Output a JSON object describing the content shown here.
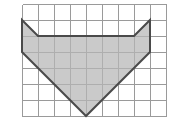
{
  "figure": {
    "background_color": "#ffffff",
    "grid": {
      "columns": 9,
      "rows": 7,
      "cell_size_px": 16,
      "origin_x_px": 22,
      "origin_y_px": 4,
      "line_color": "#9a9a9a",
      "line_width_px": 1,
      "visible": true
    },
    "shape": {
      "name": "shaded-polygon",
      "fill_color": "#b5b5b5",
      "fill_opacity": 0.72,
      "stroke_color": "#4a4a4a",
      "stroke_width_px": 2,
      "vertices_grid": [
        [
          0,
          1
        ],
        [
          1,
          2
        ],
        [
          7,
          2
        ],
        [
          8,
          1
        ],
        [
          8,
          3
        ],
        [
          4,
          7
        ],
        [
          0,
          3
        ]
      ],
      "vertices_px": [
        [
          22,
          20
        ],
        [
          38,
          36
        ],
        [
          134,
          36
        ],
        [
          150,
          20
        ],
        [
          150,
          52
        ],
        [
          86,
          116
        ],
        [
          22,
          52
        ]
      ],
      "points_attr": "22,20 38,36 134,36 150,20 150,52 86,116 22,52"
    }
  },
  "chart_data": {
    "type": "scatter",
    "xlabel": "",
    "ylabel": "",
    "xlim": [
      0,
      9
    ],
    "ylim": [
      0,
      7
    ],
    "grid": true,
    "legend": "none",
    "annotations": [],
    "series": [
      {
        "name": "shaded-polygon",
        "closed": true,
        "x": [
          0,
          1,
          7,
          8,
          8,
          4,
          0
        ],
        "y": [
          6,
          5,
          5,
          6,
          4,
          0,
          4
        ]
      }
    ]
  }
}
